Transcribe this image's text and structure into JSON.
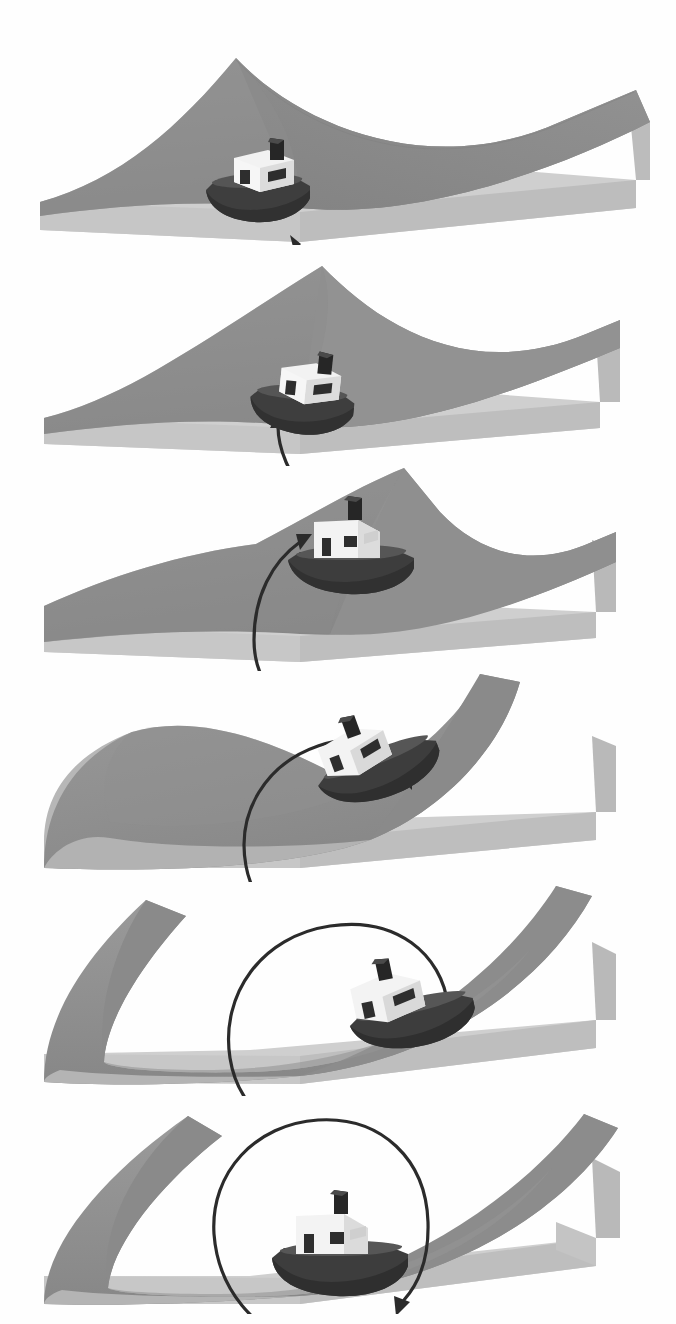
{
  "figure": {
    "caption": "",
    "background_color": "#fefefe",
    "width": 676,
    "height": 1324,
    "panel_count": 6
  },
  "palette": {
    "surface_top_dark": "#8d8d8d",
    "surface_top_mid": "#969696",
    "surface_shadow": "#7e7e7e",
    "base_front": "#cfcfcf",
    "base_top": "#bdbdbd",
    "base_right": "#b4b4b4",
    "base_edge": "#a8a8a8",
    "arrow": "#2b2b2b",
    "hull_dark": "#3c3c3c",
    "hull_mid": "#4a4a4a",
    "hull_light": "#5a5a5a",
    "cabin_white": "#f2f2f2",
    "cabin_shade": "#d8d8d8",
    "window_dark": "#2e2e2e",
    "stack_dark": "#262626",
    "background": "#ffffff"
  },
  "chart_data": {
    "type": "diagram",
    "xlabel": "",
    "ylabel": "",
    "series": [
      {
        "name": "panels",
        "values": [
          1,
          2,
          3,
          4,
          5,
          6
        ]
      }
    ],
    "panels": [
      {
        "index": 1,
        "label": "panel-1",
        "surface_type": "saddle",
        "surface_description": "Sheet rises to a peak at left-of-center and sweeps down to the right, saddle-like.",
        "boat": {
          "x": 0.36,
          "y": 0.52,
          "rotation_deg": 0,
          "scale": 1.0,
          "heading": "left-down"
        },
        "arc": {
          "sweep_deg": 55,
          "radius": 46,
          "start_angle_deg": 290,
          "end_angle_deg": 345,
          "arrowhead": "up-left",
          "description": "short hook from lower right curving up to the stern of the boat"
        },
        "top": 30,
        "height": 215
      },
      {
        "index": 2,
        "label": "panel-2",
        "surface_type": "saddle",
        "surface_description": "Same saddle, peak shifted right; boat has climbed the slope.",
        "boat": {
          "x": 0.44,
          "y": 0.46,
          "rotation_deg": 8,
          "scale": 1.0,
          "heading": "left-down"
        },
        "arc": {
          "sweep_deg": 100,
          "radius": 62,
          "start_angle_deg": 270,
          "end_angle_deg": 10,
          "arrowhead": "up",
          "description": "quarter-turn arc from bottom curving up to the boat's stern"
        },
        "top": 256,
        "height": 210
      },
      {
        "index": 3,
        "label": "panel-3",
        "surface_type": "saddle",
        "surface_description": "Saddle with its ridge running to the upper right, boat sits on the crest.",
        "boat": {
          "x": 0.49,
          "y": 0.4,
          "rotation_deg": 0,
          "scale": 1.05,
          "heading": "front"
        },
        "arc": {
          "sweep_deg": 200,
          "radius": 78,
          "start_angle_deg": 265,
          "end_angle_deg": 105,
          "arrowhead": "up-right",
          "description": "broad half-circle arc ending with arrowhead pointing up-right above the cabin"
        },
        "top": 466,
        "height": 205
      },
      {
        "index": 4,
        "label": "panel-4",
        "surface_type": "valley-with-ridge",
        "surface_description": "Sheet curves down into a trough on the left with a steep ridge climbing to the right.",
        "boat": {
          "x": 0.5,
          "y": 0.5,
          "rotation_deg": -20,
          "scale": 1.05,
          "heading": "right-up"
        },
        "arc": {
          "sweep_deg": 285,
          "radius": 86,
          "start_angle_deg": 265,
          "end_angle_deg": 190,
          "arrowhead": "right-down",
          "description": "nearly full circle closing at the bow of the boat"
        },
        "top": 672,
        "height": 210
      },
      {
        "index": 5,
        "label": "panel-5",
        "surface_type": "valley",
        "surface_description": "Deep symmetric trough, sheet sweeping up on both sides.",
        "boat": {
          "x": 0.54,
          "y": 0.58,
          "rotation_deg": -14,
          "scale": 1.05,
          "heading": "right-up"
        },
        "arc": {
          "sweep_deg": 320,
          "radius": 92,
          "start_angle_deg": 265,
          "end_angle_deg": 225,
          "arrowhead": "down",
          "description": "almost closed loop, arrowhead pointing down onto the boat's bow"
        },
        "top": 884,
        "height": 212
      },
      {
        "index": 6,
        "label": "panel-6",
        "surface_type": "valley",
        "surface_description": "Broad symmetric valley, boat resting at the lowest point.",
        "boat": {
          "x": 0.5,
          "y": 0.7,
          "rotation_deg": 0,
          "scale": 1.08,
          "heading": "front"
        },
        "arc": {
          "sweep_deg": 345,
          "radius": 98,
          "start_angle_deg": 262,
          "end_angle_deg": 247,
          "arrowhead": "down",
          "description": "full closed circle, arrowhead meeting the start point at the boat"
        },
        "top": 1098,
        "height": 216
      }
    ],
    "annotations": [
      "Each successive frame shows the boat carried further around a closed loop on the curved surface.",
      "The curved arrow grows from a short hook to a complete circle."
    ],
    "grid": false,
    "legend": null
  }
}
